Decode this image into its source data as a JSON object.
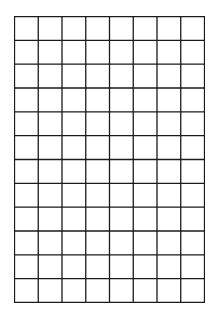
{
  "grid": {
    "columns": 8,
    "rows": 12,
    "left": 14,
    "top": 16,
    "width": 191,
    "height": 287,
    "line_color": "#1a1a1a",
    "line_width": 1.3,
    "background": "#ffffff"
  }
}
